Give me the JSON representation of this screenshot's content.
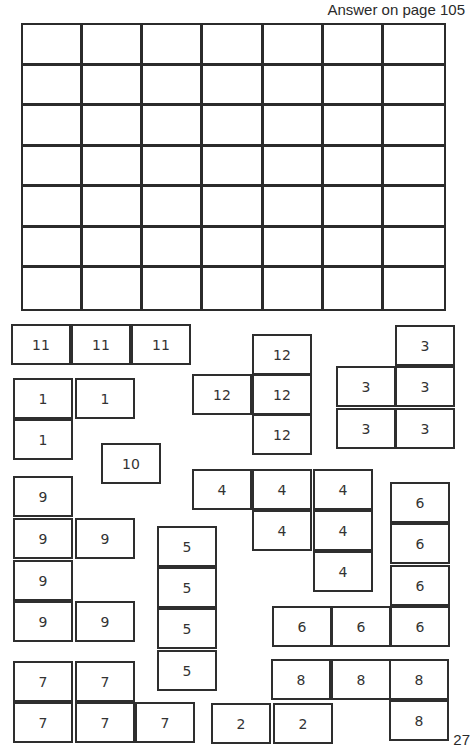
{
  "header": {
    "answer_text": "Answer on page 105"
  },
  "footer": {
    "page_number": "27"
  },
  "grid": {
    "rows": 7,
    "cols": 7
  },
  "pieces": [
    {
      "id": "11",
      "label": "11",
      "cells": [
        [
          11,
          324
        ],
        [
          71,
          324
        ],
        [
          131,
          324
        ]
      ]
    },
    {
      "id": "12",
      "label": "12",
      "cells": [
        [
          252,
          334
        ],
        [
          192,
          374
        ],
        [
          252,
          374
        ],
        [
          252,
          414
        ]
      ]
    },
    {
      "id": "3",
      "label": "3",
      "cells": [
        [
          395,
          325
        ],
        [
          336,
          366
        ],
        [
          395,
          366
        ],
        [
          336,
          408
        ],
        [
          395,
          408
        ]
      ]
    },
    {
      "id": "1",
      "label": "1",
      "cells": [
        [
          13,
          378
        ],
        [
          75,
          378
        ],
        [
          13,
          419
        ]
      ]
    },
    {
      "id": "10",
      "label": "10",
      "cells": [
        [
          101,
          443
        ]
      ]
    },
    {
      "id": "9",
      "label": "9",
      "cells": [
        [
          13,
          476
        ],
        [
          13,
          518
        ],
        [
          75,
          518
        ],
        [
          13,
          560
        ],
        [
          13,
          601
        ],
        [
          75,
          601
        ]
      ]
    },
    {
      "id": "5",
      "label": "5",
      "cells": [
        [
          157,
          526
        ],
        [
          157,
          567
        ],
        [
          157,
          608
        ],
        [
          157,
          650
        ]
      ]
    },
    {
      "id": "4",
      "label": "4",
      "cells": [
        [
          192,
          469
        ],
        [
          252,
          469
        ],
        [
          313,
          469
        ],
        [
          252,
          510
        ],
        [
          313,
          510
        ],
        [
          313,
          551
        ]
      ]
    },
    {
      "id": "6",
      "label": "6",
      "cells": [
        [
          390,
          482
        ],
        [
          390,
          523
        ],
        [
          390,
          565
        ],
        [
          272,
          606
        ],
        [
          331,
          606
        ],
        [
          390,
          606
        ]
      ]
    },
    {
      "id": "7",
      "label": "7",
      "cells": [
        [
          13,
          661
        ],
        [
          75,
          661
        ],
        [
          13,
          702
        ],
        [
          75,
          702
        ],
        [
          135,
          702
        ]
      ]
    },
    {
      "id": "8",
      "label": "8",
      "cells": [
        [
          271,
          659
        ],
        [
          331,
          659
        ],
        [
          389,
          659
        ],
        [
          389,
          700
        ]
      ]
    },
    {
      "id": "2",
      "label": "2",
      "cells": [
        [
          211,
          703
        ],
        [
          273,
          703
        ]
      ]
    }
  ]
}
